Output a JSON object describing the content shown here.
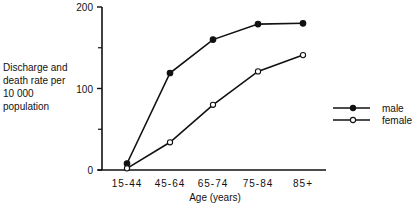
{
  "chart_data": {
    "type": "line",
    "title": "",
    "xlabel": "Age (years)",
    "ylabel": "Discharge and death rate per 10 000 population",
    "ylabel_lines": [
      "Discharge and",
      "death rate per",
      "10 000",
      "population"
    ],
    "categories": [
      "15-44",
      "45-64",
      "65-74",
      "75-84",
      "85+"
    ],
    "series": [
      {
        "name": "male",
        "marker": "filled-circle",
        "values": [
          8,
          119,
          160,
          179,
          180
        ]
      },
      {
        "name": "female",
        "marker": "open-circle",
        "values": [
          2,
          34,
          80,
          121,
          141
        ]
      }
    ],
    "ylim": [
      0,
      200
    ],
    "yticks": [
      0,
      100,
      200
    ],
    "yminor_ticks": [
      50,
      150
    ],
    "grid": false,
    "legend_position": "right"
  }
}
